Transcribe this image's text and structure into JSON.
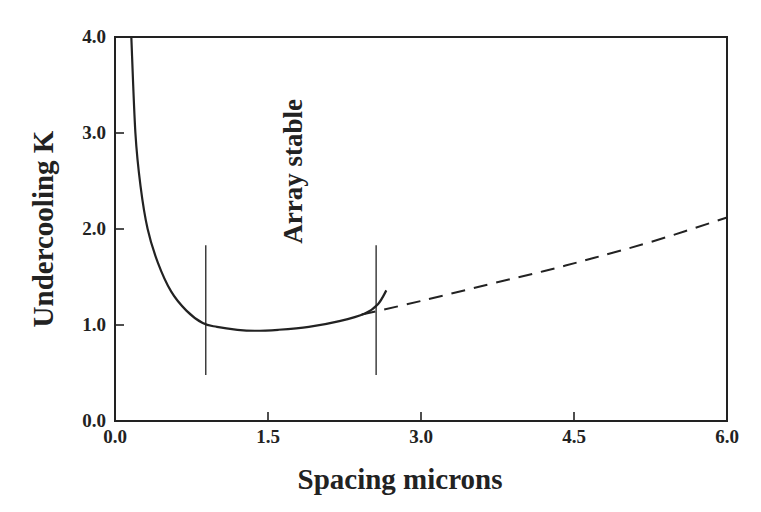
{
  "chart_data": {
    "type": "line",
    "title": "",
    "xlabel": "Spacing microns",
    "ylabel": "Undercooling K",
    "xlim": [
      0.0,
      6.0
    ],
    "ylim": [
      0.0,
      4.0
    ],
    "x_ticks": [
      "0.0",
      "1.5",
      "3.0",
      "4.5",
      "6.0"
    ],
    "y_ticks": [
      "0.0",
      "1.0",
      "2.0",
      "3.0",
      "4.0"
    ],
    "grid": false,
    "legend": null,
    "annotations": [
      {
        "text": "Array stable",
        "x": 1.75,
        "y": 2.6,
        "rotation": -90
      }
    ],
    "series": [
      {
        "name": "undercooling (solid)",
        "style": "solid",
        "x": [
          0.16,
          0.2,
          0.25,
          0.32,
          0.42,
          0.55,
          0.7,
          0.86,
          1.0,
          1.2,
          1.37,
          1.6,
          1.9,
          2.2,
          2.45,
          2.58,
          2.66
        ],
        "y": [
          4.0,
          3.0,
          2.45,
          2.0,
          1.65,
          1.35,
          1.15,
          1.02,
          0.98,
          0.95,
          0.94,
          0.95,
          0.98,
          1.04,
          1.12,
          1.22,
          1.36
        ]
      },
      {
        "name": "undercooling (dashed extension)",
        "style": "dashed",
        "x": [
          2.42,
          3.0,
          3.65,
          4.2,
          4.7,
          5.3,
          6.0
        ],
        "y": [
          1.11,
          1.25,
          1.42,
          1.56,
          1.7,
          1.88,
          2.12
        ]
      }
    ],
    "vertical_markers": [
      {
        "x": 0.89,
        "y_from": 0.48,
        "y_to": 1.83
      },
      {
        "x": 2.56,
        "y_from": 0.48,
        "y_to": 1.83
      }
    ]
  },
  "colors": {
    "ink": "#222222",
    "background": "#ffffff"
  }
}
